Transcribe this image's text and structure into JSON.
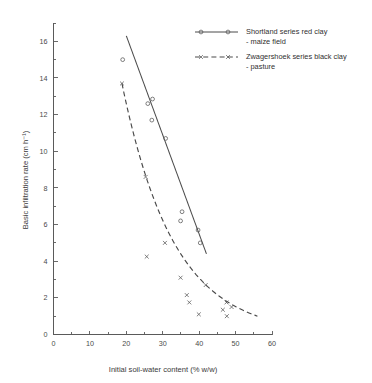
{
  "chart_data": {
    "type": "scatter",
    "title": "",
    "xlabel": "Initial soil-water content (% w/w)",
    "ylabel": "Basic infiltration rate (cm h⁻¹)",
    "xlim": [
      0,
      60
    ],
    "ylim": [
      0,
      17
    ],
    "xticks": [
      0,
      10,
      20,
      30,
      40,
      50,
      60
    ],
    "xtick_labels": [
      "0",
      "10",
      "20",
      "30",
      "40",
      "50",
      "60"
    ],
    "x_minor_ticks": [
      5,
      15,
      25,
      35,
      45,
      55
    ],
    "yticks": [
      0,
      2,
      4,
      6,
      8,
      10,
      12,
      14,
      16
    ],
    "ytick_labels": [
      "0",
      "2",
      "4",
      "6",
      "8",
      "10",
      "12",
      "14",
      "16"
    ],
    "y_minor_ticks": [
      1,
      3,
      5,
      7,
      9,
      11,
      13,
      15,
      17
    ],
    "grid": false,
    "legend_position": "top-right",
    "series": [
      {
        "name": "Shortland series red clay - maize field",
        "legend_label_line1": "Shortland series red clay",
        "legend_label_line2": "- maize field",
        "marker": "open-circle",
        "line_style": "solid",
        "points": [
          {
            "x": 19.0,
            "y": 15.0
          },
          {
            "x": 25.9,
            "y": 12.6
          },
          {
            "x": 27.2,
            "y": 12.85
          },
          {
            "x": 27.0,
            "y": 11.7
          },
          {
            "x": 30.8,
            "y": 10.7
          },
          {
            "x": 35.3,
            "y": 6.7
          },
          {
            "x": 34.9,
            "y": 6.2
          },
          {
            "x": 39.7,
            "y": 5.7
          },
          {
            "x": 40.3,
            "y": 5.0
          }
        ],
        "fit_line": {
          "x_start": 20.0,
          "y_start": 16.3,
          "x_end": 42.0,
          "y_end": 4.4
        }
      },
      {
        "name": "Zwagershoek series black clay - pasture",
        "legend_label_line1": "Zwagershoek series black clay",
        "legend_label_line2": "- pasture",
        "marker": "cross",
        "line_style": "dashed",
        "points": [
          {
            "x": 18.8,
            "y": 13.7
          },
          {
            "x": 25.3,
            "y": 8.6
          },
          {
            "x": 25.6,
            "y": 4.25
          },
          {
            "x": 30.6,
            "y": 5.0
          },
          {
            "x": 34.9,
            "y": 3.1
          },
          {
            "x": 36.6,
            "y": 2.15
          },
          {
            "x": 37.3,
            "y": 1.75
          },
          {
            "x": 39.9,
            "y": 1.1
          },
          {
            "x": 41.8,
            "y": 2.7
          },
          {
            "x": 46.5,
            "y": 1.35
          },
          {
            "x": 47.5,
            "y": 1.75
          },
          {
            "x": 47.6,
            "y": 1.0
          },
          {
            "x": 48.9,
            "y": 1.5
          }
        ],
        "fit_curve": {
          "x_start": 18.8,
          "y_start": 13.7,
          "x_end": 56.0,
          "y_end": 1.0
        }
      }
    ]
  },
  "axes": {
    "x_title": "Initial soil-water content (% w/w)",
    "y_title": "Basic infiltration rate (cm h⁻¹)"
  },
  "legend": {
    "entries": [
      {
        "line1": "Shortland series red clay",
        "line2": "- maize field",
        "marker": "open-circle",
        "style": "solid"
      },
      {
        "line1": "Zwagershoek series black clay",
        "line2": "- pasture",
        "marker": "cross",
        "style": "dashed"
      }
    ]
  },
  "colors": {
    "axis": "#5a5a5a",
    "line": "#4a4a4a",
    "marker": "#555555",
    "text": "#2f2f2f",
    "background": "#ffffff"
  }
}
